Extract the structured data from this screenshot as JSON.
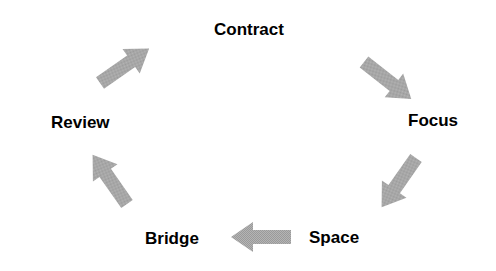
{
  "diagram": {
    "type": "cycle",
    "stages": [
      {
        "label": "Contract"
      },
      {
        "label": "Focus"
      },
      {
        "label": "Space"
      },
      {
        "label": "Bridge"
      },
      {
        "label": "Review"
      }
    ],
    "arrow_color": "#a9a9a9"
  }
}
